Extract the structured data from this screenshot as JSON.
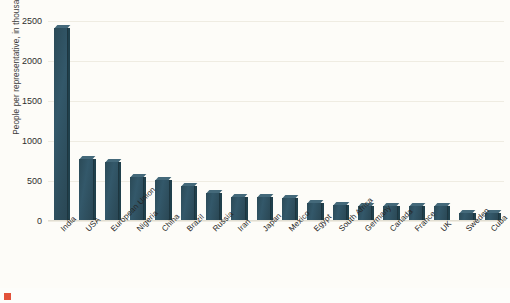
{
  "chart_data": {
    "type": "bar",
    "title": "",
    "xlabel": "",
    "ylabel": "People per representative, in thousands",
    "ylim": [
      0,
      2500
    ],
    "yticks": [
      0,
      500,
      1000,
      1500,
      2000,
      2500
    ],
    "grid": true,
    "legend": "none",
    "bar_color": "#2d4f5c",
    "categories": [
      "India",
      "USA",
      "European Union",
      "Nigeria",
      "China",
      "Brazil",
      "Russia",
      "Iran",
      "Japan",
      "Mexico",
      "Egypt",
      "South Africa",
      "Germany",
      "Canada",
      "France",
      "UK",
      "Sweden",
      "Cuba"
    ],
    "values": [
      2410,
      775,
      735,
      555,
      510,
      440,
      345,
      305,
      295,
      285,
      230,
      195,
      190,
      190,
      190,
      185,
      105,
      95
    ],
    "series": [
      {
        "name": "People per representative",
        "values": [
          2410,
          775,
          735,
          555,
          510,
          440,
          345,
          305,
          295,
          285,
          230,
          195,
          190,
          190,
          190,
          185,
          105,
          95
        ]
      }
    ]
  },
  "footer": {
    "caption": ""
  }
}
